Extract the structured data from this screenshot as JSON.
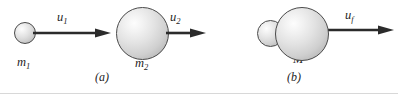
{
  "figure": {
    "type": "physics-collision-diagram",
    "background_color": "#ffffff",
    "line_color": "#2b2b2b",
    "sphere_outline_color": "#4a4a4a",
    "sphere_fill_highlight": "#fdfdfd",
    "sphere_fill_shadow": "#9e9e9e"
  },
  "panel_a": {
    "caption": "(a)",
    "velocity_labels": [
      {
        "base": "u",
        "sub": "1",
        "name": "velocity-u1"
      },
      {
        "base": "u",
        "sub": "2",
        "name": "velocity-u2"
      }
    ],
    "mass_labels": [
      {
        "base": "m",
        "sub": "1",
        "name": "mass-m1"
      },
      {
        "base": "m",
        "sub": "2",
        "name": "mass-m2"
      }
    ]
  },
  "panel_b": {
    "caption": "(b)",
    "velocity_labels": [
      {
        "base": "u",
        "sub": "f",
        "name": "velocity-uf"
      }
    ],
    "mass_labels": [
      {
        "base": "M",
        "sub": "",
        "name": "mass-M"
      }
    ]
  }
}
